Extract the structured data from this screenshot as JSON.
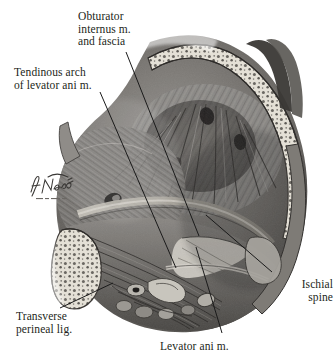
{
  "figure": {
    "domain_kind": "anatomical-illustration",
    "rendering": "grayscale halftone medical illustration on white background",
    "background_color": "#ffffff",
    "ink_color": "#231f20",
    "leader_line_color": "#1a1a1a"
  },
  "labels": [
    {
      "id": "obturator-internus",
      "lines": [
        "Obturator",
        "internus m.",
        "and fascia"
      ],
      "text": "Obturator internus m. and fascia",
      "align": "left",
      "x": 78,
      "y": 10
    },
    {
      "id": "tendinous-arch",
      "lines": [
        "Tendinous arch",
        "of levator ani m."
      ],
      "text": "Tendinous arch of levator ani m.",
      "align": "left",
      "x": 14,
      "y": 66
    },
    {
      "id": "ischial-spine",
      "lines": [
        "Ischial",
        "spine"
      ],
      "text": "Ischial spine",
      "align": "right",
      "x": 333,
      "y": 278
    },
    {
      "id": "transverse-perineal-lig",
      "lines": [
        "Transverse",
        "perineal lig."
      ],
      "text": "Transverse perineal lig.",
      "align": "left",
      "x": 16,
      "y": 310
    },
    {
      "id": "levator-ani",
      "lines": [
        "Levator ani m."
      ],
      "text": "Levator ani m.",
      "align": "left",
      "x": 160,
      "y": 340
    }
  ],
  "leader_lines": [
    {
      "id": "leader-obturator-internus",
      "from": [
        126,
        52
      ],
      "to": [
        199,
        236
      ]
    },
    {
      "id": "leader-tendinous-arch",
      "from": [
        100,
        92
      ],
      "to": [
        176,
        268
      ]
    },
    {
      "id": "leader-ischial-spine",
      "from": [
        272,
        272
      ],
      "to": [
        206,
        215
      ]
    },
    {
      "id": "leader-transverse-perineal",
      "from": [
        60,
        308
      ],
      "to": [
        113,
        283
      ]
    },
    {
      "id": "leader-levator-ani",
      "from": [
        222,
        333
      ],
      "to": [
        196,
        247
      ]
    }
  ],
  "signature": {
    "artist_mark": "F. Netter",
    "sub_mark": "© CIBA",
    "x": 28,
    "y": 170
  },
  "anatomy_parts": [
    {
      "id": "ilium-cut-bone-upper",
      "note": "cut iliac bone with cancellous trabecular texture, upper right arc"
    },
    {
      "id": "obturator-internus-muscle",
      "note": "large fan of radiating muscle fibers filling the central basin"
    },
    {
      "id": "levator-ani-muscle",
      "note": "sheet of muscle sweeping across the lower pelvic outlet"
    },
    {
      "id": "tendinous-arch-band",
      "note": "pale fibrous band crossing obliquely over obturator fascia"
    },
    {
      "id": "ischial-spine-bone",
      "note": "bony prominence at right lower margin"
    },
    {
      "id": "pubic-bone-cut",
      "note": "cut pubic bone with trabecular texture, lower left"
    },
    {
      "id": "urogenital-structures",
      "note": "small tubular and nodular structures along the inferior midline"
    }
  ]
}
